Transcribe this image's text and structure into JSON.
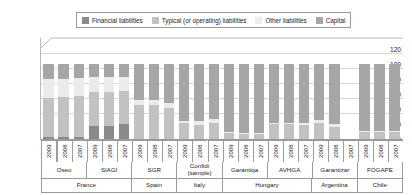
{
  "legend": {
    "items": [
      {
        "label": "Financial liabilities",
        "color": "#8a8a8a"
      },
      {
        "label": "Typical (or operating) liabilities",
        "color": "#c2c2c2"
      },
      {
        "label": "Other liabilities",
        "color": "#ebebeb"
      },
      {
        "label": "Capital",
        "color": "#a6a6a6"
      }
    ]
  },
  "chart_data": {
    "type": "bar",
    "subtype": "stacked-percentage",
    "title": "",
    "xlabel": "",
    "ylabel": "",
    "ylim": [
      0,
      120
    ],
    "yticks": [
      0,
      20,
      40,
      60,
      80,
      100,
      120
    ],
    "grid": true,
    "legend_position": "top",
    "categories": [
      "2009",
      "2008",
      "2007",
      "2009",
      "2008",
      "2007",
      "2009",
      "2008",
      "2007",
      "2009",
      "2008",
      "2007",
      "2009",
      "2008",
      "2007",
      "2009",
      "2008",
      "2007",
      "2009",
      "2008",
      "2007",
      "2009",
      "2008",
      "2007"
    ],
    "series": [
      {
        "name": "Financial liabilities",
        "color": "#8a8a8a",
        "values": [
          3,
          3,
          3,
          18,
          18,
          20,
          0,
          0,
          0,
          0,
          0,
          0,
          0,
          0,
          0,
          0,
          0,
          0,
          0,
          0,
          null,
          0,
          0,
          0
        ]
      },
      {
        "name": "Typical (or operating) liabilities",
        "color": "#c2c2c2",
        "values": [
          52,
          53,
          55,
          45,
          45,
          44,
          46,
          46,
          42,
          21,
          19,
          22,
          8,
          7,
          7,
          20,
          20,
          19,
          22,
          16,
          null,
          10,
          10,
          10
        ]
      },
      {
        "name": "Other liabilities",
        "color": "#ebebeb",
        "values": [
          25,
          24,
          23,
          20,
          20,
          19,
          6,
          6,
          6,
          3,
          5,
          5,
          1,
          1,
          1,
          2,
          2,
          2,
          3,
          4,
          null,
          1,
          1,
          1
        ]
      },
      {
        "name": "Capital",
        "color": "#a6a6a6",
        "values": [
          20,
          20,
          19,
          17,
          17,
          17,
          48,
          48,
          52,
          76,
          76,
          73,
          91,
          92,
          92,
          78,
          78,
          79,
          75,
          80,
          null,
          89,
          89,
          89
        ]
      }
    ],
    "institutions": [
      {
        "label": "Oseo",
        "span": 3
      },
      {
        "label": "SIAGI",
        "span": 3
      },
      {
        "label": "SGR",
        "span": 3
      },
      {
        "label": "Confidi (sample)",
        "span": 3
      },
      {
        "label": "Garantiqa",
        "span": 3
      },
      {
        "label": "AVHGA",
        "span": 3
      },
      {
        "label": "Garantizar",
        "span": 3
      },
      {
        "label": "FOGAPE",
        "span": 3
      }
    ],
    "countries": [
      {
        "label": "France",
        "span": 6
      },
      {
        "label": "Spain",
        "span": 3
      },
      {
        "label": "Italy",
        "span": 3
      },
      {
        "label": "Hungary",
        "span": 6
      },
      {
        "label": "Argentina",
        "span": 3
      },
      {
        "label": "Chile",
        "span": 3
      }
    ]
  }
}
